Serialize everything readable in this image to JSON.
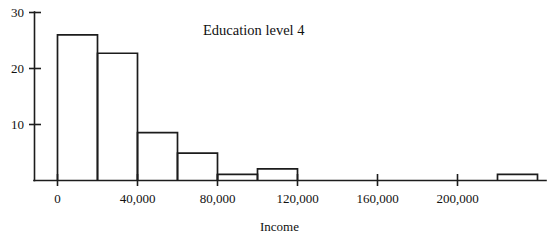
{
  "chart_data": {
    "type": "bar",
    "title": "Education level 4",
    "xlabel": "Income",
    "ylabel": "",
    "bin_width": 20000,
    "categories": [
      "0-20,000",
      "20,000-40,000",
      "40,000-60,000",
      "60,000-80,000",
      "80,000-100,000",
      "100,000-120,000",
      "120,000-140,000",
      "140,000-160,000",
      "160,000-180,000",
      "180,000-200,000",
      "200,000-220,000",
      "220,000-240,000"
    ],
    "bin_starts": [
      0,
      20000,
      40000,
      60000,
      80000,
      100000,
      120000,
      140000,
      160000,
      180000,
      200000,
      220000
    ],
    "values": [
      26,
      22.7,
      8.5,
      4.8,
      1,
      2,
      0,
      0,
      0,
      0,
      0,
      1
    ],
    "xlim": [
      -20000,
      245000
    ],
    "ylim": [
      0,
      31
    ],
    "xticks": [
      0,
      40000,
      80000,
      120000,
      160000,
      200000
    ],
    "xtick_labels": [
      "0",
      "40,000",
      "80,000",
      "120,000",
      "160,000",
      "200,000"
    ],
    "yticks": [
      10,
      20,
      30
    ],
    "ytick_labels": [
      "10",
      "20",
      "30"
    ],
    "grid": false,
    "legend": "none",
    "bar_fill": "#ffffff",
    "bar_stroke": "#1c1c1c",
    "axis_color": "#1c1c1c"
  }
}
